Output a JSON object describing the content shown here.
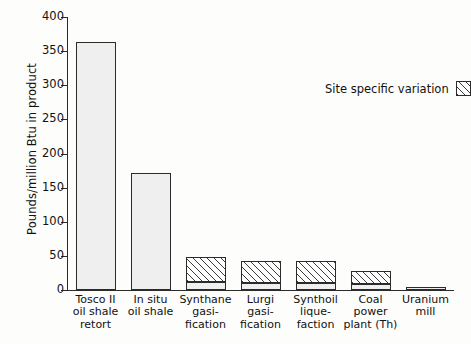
{
  "chart_data": {
    "type": "bar",
    "title": "",
    "xlabel": "",
    "ylabel": "Pounds/million Btu in product",
    "ylim": [
      0,
      400
    ],
    "ytick_values": [
      0,
      50,
      100,
      150,
      200,
      250,
      300,
      350,
      400
    ],
    "ytick_labels": [
      "0",
      "50",
      "100",
      "150",
      "200",
      "250",
      "300",
      "350",
      "400"
    ],
    "grid": false,
    "legend": {
      "position": "upper-right-inside",
      "entries": [
        {
          "label": "Site specific variation",
          "pattern": "diagonal-hatch"
        }
      ]
    },
    "categories": [
      "Tosco II\noil shale\nretort",
      "In situ\noil shale",
      "Synthane\ngasi-\nfication",
      "Lurgi\ngasi-\nfication",
      "Synthoil\nlique-\nfaction",
      "Coal power\nplant (Th)",
      "Uranium\nmill"
    ],
    "series": [
      {
        "name": "Base value",
        "pattern": "stipple",
        "values": [
          363,
          171,
          12,
          10,
          10,
          9,
          4
        ]
      },
      {
        "name": "Site specific variation",
        "pattern": "diagonal-hatch",
        "values": [
          0,
          0,
          37,
          33,
          33,
          19,
          0
        ]
      }
    ],
    "totals": [
      363,
      171,
      49,
      43,
      43,
      28,
      4
    ]
  },
  "legend": {
    "label": "Site specific variation"
  },
  "axis": {
    "y_title": "Pounds/million Btu in product"
  }
}
